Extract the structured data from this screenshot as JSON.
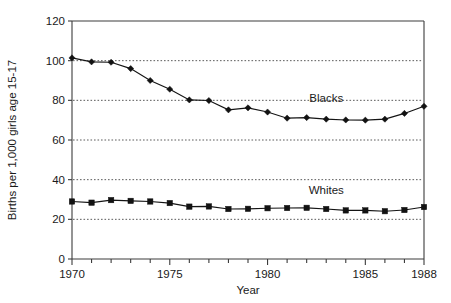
{
  "chart_data": {
    "type": "line",
    "title": "",
    "subtitle": "",
    "xlabel": "Year",
    "ylabel": "Births per 1,000 girls age 15-17",
    "xlim": [
      1970,
      1988
    ],
    "ylim": [
      0,
      120
    ],
    "ytick_labels": [
      "0",
      "20",
      "40",
      "60",
      "80",
      "100",
      "120"
    ],
    "ytick_values": [
      0,
      20,
      40,
      60,
      80,
      100,
      120
    ],
    "xtick_labels": [
      "1970",
      "1975",
      "1980",
      "1985",
      "1988"
    ],
    "xtick_values": [
      1970,
      1975,
      1980,
      1985,
      1988
    ],
    "x_minor_tick_interval": 1,
    "grid": "horizontal dotted gridlines at 20, 40, 60, 80, 100",
    "gridline_values": [
      20,
      40,
      60,
      80,
      100
    ],
    "legend_position": "inline annotations beside each series",
    "x": [
      1970,
      1971,
      1972,
      1973,
      1974,
      1975,
      1976,
      1977,
      1978,
      1979,
      1980,
      1981,
      1982,
      1983,
      1984,
      1985,
      1986,
      1987,
      1988
    ],
    "series": [
      {
        "name": "Blacks",
        "marker": "diamond",
        "annotation": "Blacks",
        "annotation_x": 1983,
        "annotation_y": 79,
        "values": [
          101.4,
          99.4,
          99.2,
          96.0,
          90.0,
          85.6,
          80.2,
          79.9,
          75.2,
          76.2,
          74.1,
          71.0,
          71.3,
          70.5,
          70.1,
          70.0,
          70.5,
          73.4,
          77.0
        ]
      },
      {
        "name": "Whites",
        "marker": "square",
        "annotation": "Whites",
        "annotation_x": 1983,
        "annotation_y": 33,
        "values": [
          29.0,
          28.4,
          29.7,
          29.3,
          29.0,
          28.2,
          26.4,
          26.5,
          25.2,
          25.3,
          25.6,
          25.7,
          25.8,
          25.2,
          24.5,
          24.5,
          24.1,
          24.7,
          26.2
        ]
      }
    ]
  },
  "axes": {
    "x_axis_name": "Year",
    "y_axis_name": "Births per 1,000 girls age 15-17"
  }
}
